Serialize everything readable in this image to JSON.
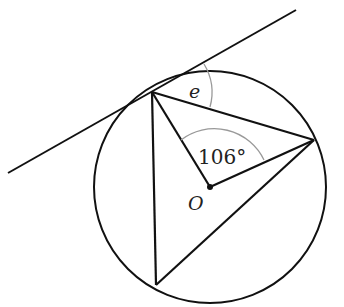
{
  "diagram": {
    "labels": {
      "angle_e": "e",
      "angle_center": "106°",
      "center": "O"
    },
    "colors": {
      "line": "#111111",
      "arc": "#999999",
      "background": "#ffffff"
    }
  }
}
